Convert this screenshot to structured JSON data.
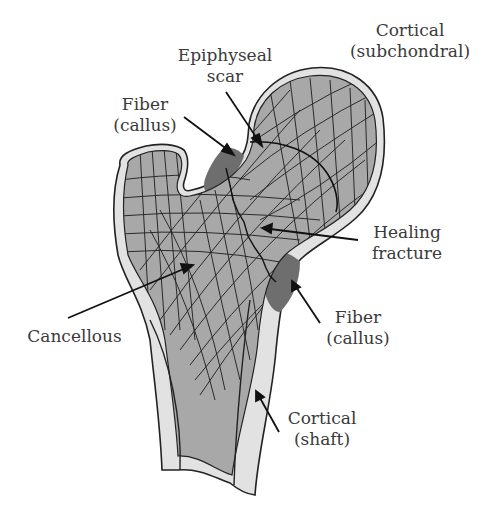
{
  "diagram": {
    "colors": {
      "cancellous": "#a8a8a8",
      "cancellous_light": "#b4b4b4",
      "cortical": "#e2e2e2",
      "callus": "#6e6e6e",
      "outline": "#222222",
      "text": "#3a3a3a"
    },
    "labels": {
      "cortical_subchondral": {
        "line1": "Cortical",
        "line2": "(subchondral)"
      },
      "epiphyseal_scar": {
        "line1": "Epiphyseal",
        "line2": "scar"
      },
      "fiber_callus_top": {
        "line1": "Fiber",
        "line2": "(callus)"
      },
      "healing_fracture": {
        "line1": "Healing",
        "line2": "fracture"
      },
      "fiber_callus_bottom": {
        "line1": "Fiber",
        "line2": "(callus)"
      },
      "cancellous": {
        "line1": "Cancellous"
      },
      "cortical_shaft": {
        "line1": "Cortical",
        "line2": "(shaft)"
      }
    }
  }
}
